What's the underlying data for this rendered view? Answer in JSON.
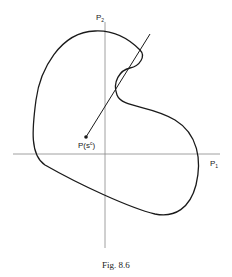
{
  "figure": {
    "caption": "Fig. 8.6",
    "axes": {
      "x_label": "P",
      "x_label_subscript": "1",
      "y_label": "P",
      "y_label_subscript": "2"
    },
    "point": {
      "label": "P(s",
      "label_superscript": "c",
      "label_close": ")"
    }
  },
  "colors": {
    "curve": "#1a1a1a",
    "axis": "#888888"
  }
}
